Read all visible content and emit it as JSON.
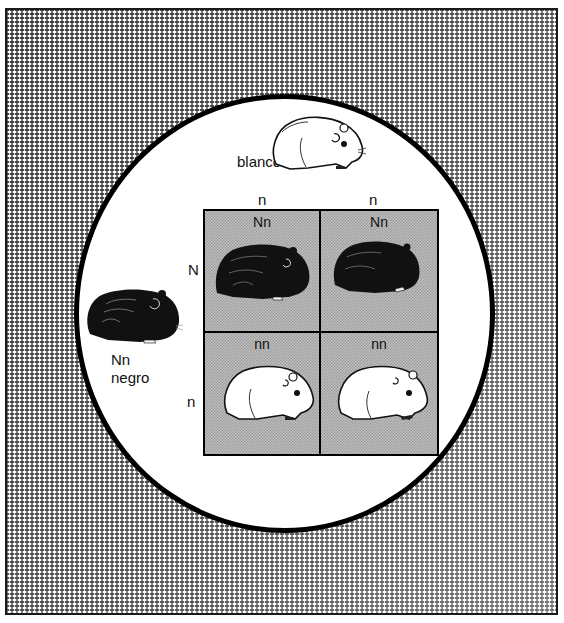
{
  "diagram": {
    "type": "punnett-square",
    "parents": {
      "top": {
        "genotype": "nn",
        "phenotype": "blanco",
        "color": "white"
      },
      "left": {
        "genotype": "Nn",
        "phenotype": "negro",
        "color": "black"
      }
    },
    "column_alleles": [
      "n",
      "n"
    ],
    "row_alleles": [
      "N",
      "n"
    ],
    "cells": [
      [
        {
          "genotype": "Nn",
          "color": "black"
        },
        {
          "genotype": "Nn",
          "color": "black"
        }
      ],
      [
        {
          "genotype": "nn",
          "color": "white"
        },
        {
          "genotype": "nn",
          "color": "white"
        }
      ]
    ]
  },
  "colors": {
    "background_mesh": "#3a3a3a",
    "circle_border": "#000000",
    "grid_fill": "#bdbdbd"
  }
}
